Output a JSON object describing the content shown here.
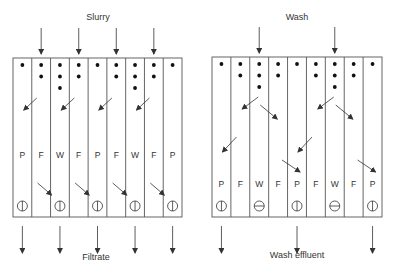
{
  "left_panel": {
    "title": "Slurry",
    "bottom_label": "Filtrate",
    "x": 13,
    "y": 58,
    "width": 169,
    "height": 159,
    "columns": [
      "P",
      "F",
      "W",
      "F",
      "P",
      "F",
      "W",
      "F",
      "P"
    ],
    "dots": [
      1,
      2,
      3,
      2,
      1,
      2,
      3,
      2,
      1
    ],
    "valve_columns": [
      0,
      2,
      4,
      6,
      8
    ],
    "valve_types": [
      "open",
      "open",
      "open",
      "open",
      "open"
    ],
    "inlet_columns": [
      1,
      3,
      5,
      7
    ],
    "outlet_columns": [
      0,
      2,
      4,
      6,
      8
    ]
  },
  "right_panel": {
    "title": "Wash",
    "bottom_label": "Wash effluent",
    "x": 212,
    "y": 57,
    "width": 170,
    "height": 160,
    "columns": [
      "P",
      "F",
      "W",
      "F",
      "P",
      "F",
      "W",
      "F",
      "P"
    ],
    "dots": [
      1,
      2,
      3,
      2,
      1,
      2,
      3,
      2,
      1
    ],
    "valve_columns": [
      0,
      2,
      4,
      6,
      8
    ],
    "valve_types": [
      "open",
      "closed",
      "open",
      "closed",
      "open"
    ],
    "inlet_columns": [
      2,
      6
    ],
    "outlet_columns": [
      0,
      4,
      8
    ]
  }
}
